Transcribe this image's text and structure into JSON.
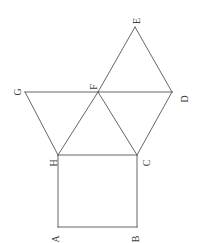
{
  "figure": {
    "background_color": "#ffffff",
    "stroke_color": "#555555",
    "stroke_width": 0.9,
    "label_color": "#3a3a3a",
    "label_rotation_deg": -90,
    "canvas": {
      "width": 202,
      "height": 243
    }
  },
  "points": {
    "A": {
      "label": "A",
      "x": 58,
      "y": 227,
      "label_x": 52,
      "label_y": 234
    },
    "B": {
      "label": "B",
      "x": 137,
      "y": 227,
      "label_x": 133,
      "label_y": 234
    },
    "C": {
      "label": "C",
      "x": 137,
      "y": 155,
      "label_x": 144,
      "label_y": 158
    },
    "D": {
      "label": "D",
      "x": 172,
      "y": 92,
      "label_x": 181,
      "label_y": 94
    },
    "E": {
      "label": "E",
      "x": 135,
      "y": 27,
      "label_x": 134,
      "label_y": 16
    },
    "F": {
      "label": "F",
      "x": 98,
      "y": 92,
      "label_x": 91,
      "label_y": 82
    },
    "G": {
      "label": "G",
      "x": 25,
      "y": 92,
      "label_x": 14,
      "label_y": 87
    },
    "H": {
      "label": "H",
      "x": 58,
      "y": 155,
      "label_x": 50,
      "label_y": 158
    }
  },
  "segments": [
    {
      "name": "segment-A-B",
      "from": "A",
      "to": "B"
    },
    {
      "name": "segment-B-C",
      "from": "B",
      "to": "C"
    },
    {
      "name": "segment-C-H",
      "from": "C",
      "to": "H"
    },
    {
      "name": "segment-H-A",
      "from": "H",
      "to": "A"
    },
    {
      "name": "segment-G-D",
      "from": "G",
      "to": "D"
    },
    {
      "name": "segment-G-H",
      "from": "G",
      "to": "H"
    },
    {
      "name": "segment-H-F",
      "from": "H",
      "to": "F"
    },
    {
      "name": "segment-F-C",
      "from": "F",
      "to": "C"
    },
    {
      "name": "segment-C-D",
      "from": "C",
      "to": "D"
    },
    {
      "name": "segment-F-E",
      "from": "F",
      "to": "E"
    },
    {
      "name": "segment-E-D",
      "from": "E",
      "to": "D"
    }
  ],
  "shapes": [
    {
      "name": "square-ABCH",
      "vertices": [
        "A",
        "B",
        "C",
        "H"
      ]
    },
    {
      "name": "triangle-GHF",
      "vertices": [
        "G",
        "H",
        "F"
      ]
    },
    {
      "name": "triangle-HFC",
      "vertices": [
        "H",
        "F",
        "C"
      ]
    },
    {
      "name": "triangle-FCD",
      "vertices": [
        "F",
        "C",
        "D"
      ]
    },
    {
      "name": "triangle-FED",
      "vertices": [
        "F",
        "E",
        "D"
      ]
    }
  ]
}
